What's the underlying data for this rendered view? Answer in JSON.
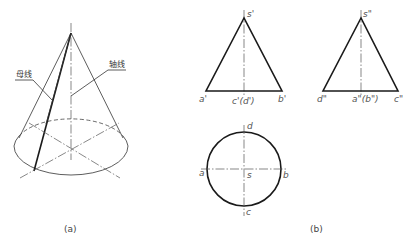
{
  "figure_a": {
    "caption": "(a)",
    "label_generatrix": "母线",
    "label_axis": "轴线"
  },
  "figure_b": {
    "caption": "(b)",
    "front_view": {
      "apex": "s'",
      "left_base": "a'",
      "center_base": "c'(d')",
      "right_base": "b'"
    },
    "side_view": {
      "apex": "s\"",
      "left_base": "d\"",
      "center_base": "a\"(b\")",
      "right_base": "c\""
    },
    "top_view": {
      "top": "d",
      "left": "a",
      "center": "s",
      "right": "b",
      "bottom": "c"
    }
  },
  "colors": {
    "line": "#1a1a1a",
    "label": "#555555",
    "background": "#ffffff"
  }
}
